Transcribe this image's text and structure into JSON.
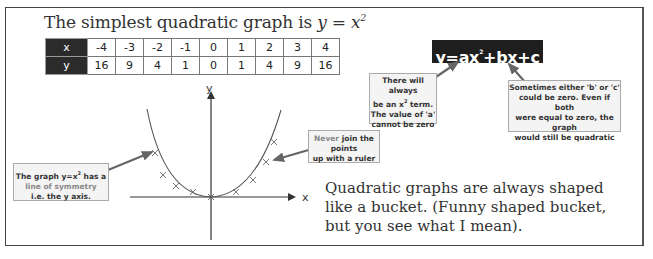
{
  "title": {
    "prefix": "The simplest quadratic graph is ",
    "equation": "y = x",
    "exponent": "2"
  },
  "table": {
    "rows": [
      {
        "label": "x",
        "values": [
          "-4",
          "-3",
          "-2",
          "-1",
          "0",
          "1",
          "2",
          "3",
          "4"
        ]
      },
      {
        "label": "y",
        "values": [
          "16",
          "9",
          "4",
          "1",
          "0",
          "1",
          "4",
          "9",
          "16"
        ]
      }
    ]
  },
  "formula": {
    "part1": "y=ax",
    "exp": "2",
    "part2": "+bx+c"
  },
  "notes": {
    "a_term": {
      "line1": "There will always",
      "line2_pre": "be an x",
      "line2_exp": "2",
      "line2_post": " term.",
      "line3": "The value of 'a'",
      "line4": "cannot be zero"
    },
    "b_c_zero": {
      "line1": "Sometimes either 'b' or 'c'",
      "line2": "could be zero. Even if both",
      "line3": "were equal to zero, the graph",
      "line4": "would still be quadratic"
    },
    "ruler": {
      "highlight": "Never",
      "line1_rest": " join the points",
      "line2": "up with a ruler"
    },
    "symmetry": {
      "line1_pre": "The graph y=x",
      "line1_exp": "2",
      "line1_post": " has a",
      "line2": "line of symmetry",
      "line3": "i.e. the y axis."
    }
  },
  "graph": {
    "x_axis_label": "x",
    "y_axis_label": "y",
    "colors": {
      "axis": "#333333",
      "curve": "#555555",
      "arrow": "#666666"
    }
  },
  "body_text": {
    "line1": "Quadratic graphs are always shaped",
    "line2": "like a bucket. (Funny shaped bucket,",
    "line3": "but you see what I mean)."
  }
}
